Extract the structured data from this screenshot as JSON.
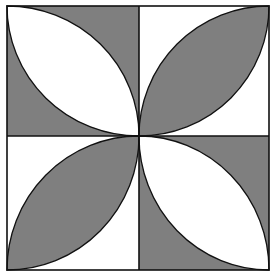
{
  "figure": {
    "colors": {
      "shade": "#7f7f7f",
      "background": "#ffffff",
      "stroke": "#111111"
    },
    "quadrants": [
      {
        "position": "top-left",
        "lens_diagonal": "top-left to bottom-right",
        "lens_fill": "background",
        "corner_fill": "shade"
      },
      {
        "position": "top-right",
        "lens_diagonal": "bottom-left to top-right",
        "lens_fill": "shade",
        "corner_fill": "background"
      },
      {
        "position": "bottom-left",
        "lens_diagonal": "bottom-left to top-right",
        "lens_fill": "shade",
        "corner_fill": "background"
      },
      {
        "position": "bottom-right",
        "lens_diagonal": "top-left to bottom-right",
        "lens_fill": "background",
        "corner_fill": "shade"
      }
    ]
  }
}
